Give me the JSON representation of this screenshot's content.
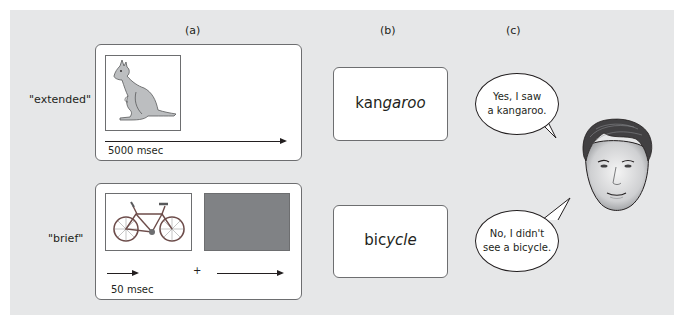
{
  "figure": {
    "background_color": "#e6e7e8",
    "column_headers": [
      {
        "id": "a",
        "label": "(a)"
      },
      {
        "id": "b",
        "label": "(b)"
      },
      {
        "id": "c",
        "label": "(c)"
      }
    ],
    "rows": [
      {
        "condition_label": "\"extended\"",
        "stimulus": {
          "picture": "kangaroo",
          "duration_label": "5000 msec"
        },
        "word": {
          "plain": "kan",
          "italic": "garoo"
        },
        "response": {
          "line1": "Yes, I saw",
          "line2": "a kangaroo."
        }
      },
      {
        "condition_label": "\"brief\"",
        "stimulus": {
          "picture": "bicycle",
          "duration_label": "50 msec",
          "separator": "+",
          "mask_color": "#808285"
        },
        "word": {
          "plain": "bic",
          "italic": "ycle"
        },
        "response": {
          "line1": "No, I didn't",
          "line2": "see a bicycle."
        }
      }
    ],
    "participant": "face-illustration"
  }
}
